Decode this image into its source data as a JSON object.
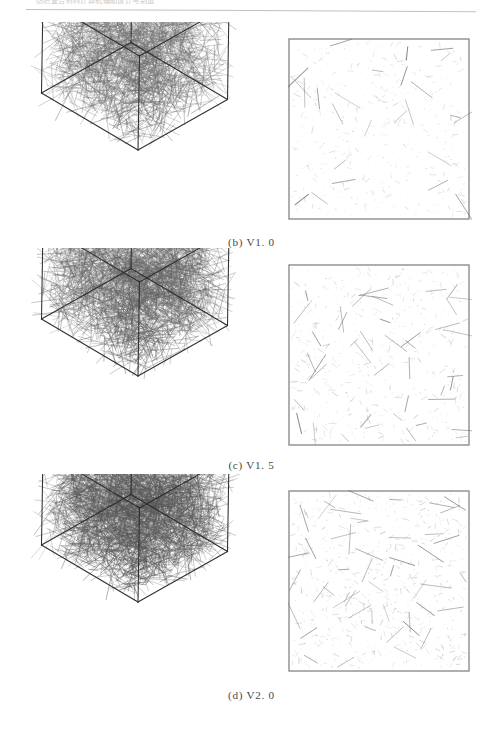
{
  "header": {
    "running_head": "纺织复合材料计算机辅助设计与制造",
    "rule": "horizontal-rule"
  },
  "figure": {
    "rows": [
      {
        "id": "row-b",
        "caption": "(b) V1. 0",
        "caption_index": "(b)",
        "caption_value": "V1. 0",
        "cube": {
          "name": "3d-fiber-cube-v1-0",
          "fiber_count": 2200,
          "ink": "#6b6b6b",
          "density_label": "V1.0",
          "edge_color": "#2f2f2f"
        },
        "section": {
          "name": "cross-section-v1-0",
          "mark_count": 520,
          "ink": "#9a9a9a",
          "border_color": "#8d8d8d"
        }
      },
      {
        "id": "row-c",
        "caption": "(c) V1. 5",
        "caption_index": "(c)",
        "caption_value": "V1. 5",
        "cube": {
          "name": "3d-fiber-cube-v1-5",
          "fiber_count": 2900,
          "ink": "#636363",
          "density_label": "V1.5",
          "edge_color": "#2f2f2f"
        },
        "section": {
          "name": "cross-section-v1-5",
          "mark_count": 640,
          "ink": "#949494",
          "border_color": "#8d8d8d"
        }
      },
      {
        "id": "row-d",
        "caption": "(d) V2. 0",
        "caption_index": "(d)",
        "caption_value": "V2. 0",
        "cube": {
          "name": "3d-fiber-cube-v2-0",
          "fiber_count": 3700,
          "ink": "#575757",
          "density_label": "V2.0",
          "edge_color": "#2d2d2d"
        },
        "section": {
          "name": "cross-section-v2-0",
          "mark_count": 800,
          "ink": "#8a8a8a",
          "border_color": "#8d8d8d"
        }
      }
    ]
  },
  "chart_data": {
    "type": "scatter",
    "title": "",
    "panels": [
      {
        "label": "(b) V1. 0",
        "volume_fraction": 1.0,
        "relative_density": 1.0
      },
      {
        "label": "(c) V1. 5",
        "volume_fraction": 1.5,
        "relative_density": 1.32
      },
      {
        "label": "(d) V2. 0",
        "volume_fraction": 2.0,
        "relative_density": 1.68
      }
    ],
    "xlabel": "",
    "ylabel": "",
    "grid": false,
    "legend": "none"
  }
}
